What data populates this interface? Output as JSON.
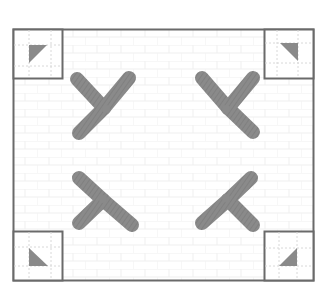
{
  "diagram": {
    "title": "",
    "colors": {
      "frame": "#6a6a6a",
      "motif": "#8a8a8a",
      "guide": "#d8d8d8",
      "background": "#ffffff",
      "pattern": "#efefef"
    },
    "corners": [
      {
        "position": "top-left",
        "triangle_orientation": "right-angle-top-left"
      },
      {
        "position": "top-right",
        "triangle_orientation": "right-angle-top-right"
      },
      {
        "position": "bottom-left",
        "triangle_orientation": "right-angle-bottom-left"
      },
      {
        "position": "bottom-right",
        "triangle_orientation": "right-angle-bottom-right"
      }
    ],
    "fans": [
      {
        "position": "top-left",
        "blades": 3
      },
      {
        "position": "top-right",
        "blades": 3
      },
      {
        "position": "bottom-left",
        "blades": 3
      },
      {
        "position": "bottom-right",
        "blades": 3
      }
    ]
  }
}
